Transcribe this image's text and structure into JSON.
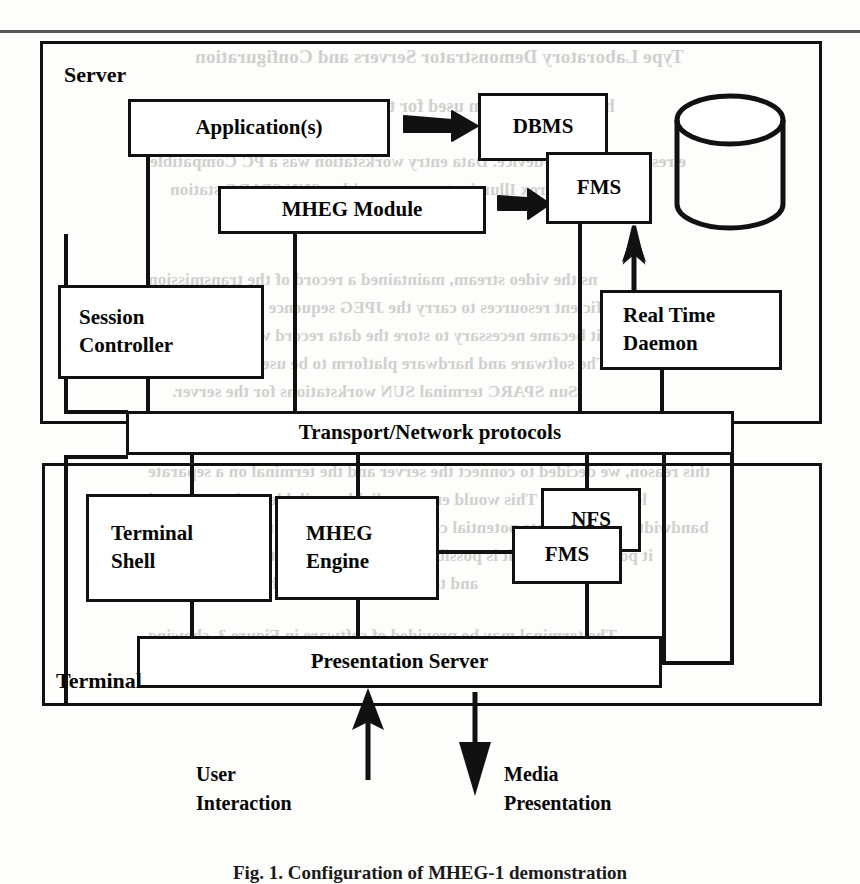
{
  "figure": {
    "caption": "Fig. 1. Configuration of MHEG-1 demonstration",
    "containers": [
      {
        "key": "server",
        "label": "Server"
      },
      {
        "key": "terminal",
        "label": "Terminal"
      }
    ],
    "boxes": [
      {
        "key": "application",
        "label": "Application(s)"
      },
      {
        "key": "mheg_module",
        "label": "MHEG Module"
      },
      {
        "key": "session_controller",
        "label": "Session\nController"
      },
      {
        "key": "dbms",
        "label": "DBMS"
      },
      {
        "key": "fms_server",
        "label": "FMS"
      },
      {
        "key": "real_time_daemon",
        "label": "Real Time\nDaemon"
      },
      {
        "key": "transport",
        "label": "Transport/Network protocols"
      },
      {
        "key": "terminal_shell",
        "label": "Terminal\nShell"
      },
      {
        "key": "mheg_engine",
        "label": "MHEG\nEngine"
      },
      {
        "key": "nfs",
        "label": "NFS"
      },
      {
        "key": "fms_terminal",
        "label": "FMS"
      },
      {
        "key": "presentation_server",
        "label": "Presentation  Server"
      }
    ],
    "flow_labels": [
      {
        "key": "user_interaction",
        "label": "User\nInteraction"
      },
      {
        "key": "media_presentation",
        "label": "Media\nPresentation"
      }
    ],
    "storage_symbol": "database-cylinder",
    "colors": {
      "ink": "#111111",
      "paper": "#fdfdfc",
      "bleed_text": "#c9c9c6"
    }
  },
  "bleed_text": {
    "lines": [
      "Type Laboratory Demonstrator Servers and Configuration",
      "he server platform used for the Laboratory Demonstrator",
      "e resolution colour device. Data entry workstation was a PC Compatible",
      "using a Matrox Illuminator system with a SUN SPARC station",
      "sing",
      "ns the video stream, maintained a record of the transmission",
      "were sufficient resources to carry the JPEG sequence over a 64Mbit/s",
      "link, it became necessary to store the data record with prior to the",
      "simulator. The software and hardware platform to be used in the project",
      "Sun SPARC terminal SUN workstations for the server.",
      "this reason, we decided to connect the server and the terminal on a separate",
      "local network. This would ensure reliable available cycles and good",
      "bandwidth and eliminate potential collisions on the public network to make",
      "it possible to see if it is possible to bridge the two Ethernet networks",
      "and to set the terminal on the same segment.",
      "The terminal may be provided of software in Figure 3, showing",
      "relevant parts of the software architecture."
    ]
  }
}
